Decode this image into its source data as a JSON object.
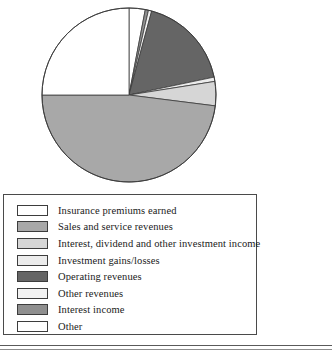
{
  "chart_data": {
    "type": "pie",
    "title": "",
    "subtitle": "",
    "xlabel": "",
    "ylabel": "",
    "legend_position": "bottom-left",
    "start_angle_deg": 0,
    "direction": "clockwise",
    "categories": [
      "Insurance premiums earned",
      "Sales and service revenues",
      "Interest, dividend and other investment income",
      "Investment gains/losses",
      "Operating revenues",
      "Other revenues",
      "Interest income",
      "Other"
    ],
    "values": [
      25.0,
      48.0,
      4.5,
      0.8,
      17.5,
      0.6,
      0.6,
      3.0
    ],
    "slice_colors": [
      "#ffffff",
      "#a8a8a8",
      "#d6d6d6",
      "#ececec",
      "#656565",
      "#f2f2f2",
      "#8f8f8f",
      "#ffffff"
    ],
    "slice_order_from_12oclock": [
      "Other",
      "Interest income",
      "Other revenues",
      "Operating revenues",
      "Investment gains/losses",
      "Interest, dividend and other investment income",
      "Sales and service revenues",
      "Insurance premiums earned"
    ],
    "geometry": {
      "center_x": 129,
      "center_y": 95,
      "radius": 87
    }
  },
  "legend": {
    "items": [
      {
        "label": "Insurance premiums earned",
        "color": "#ffffff"
      },
      {
        "label": "Sales and service revenues",
        "color": "#a8a8a8"
      },
      {
        "label": "Interest, dividend and other investment income",
        "color": "#d6d6d6"
      },
      {
        "label": "Investment gains/losses",
        "color": "#ececec"
      },
      {
        "label": "Operating revenues",
        "color": "#656565"
      },
      {
        "label": "Other revenues",
        "color": "#f2f2f2"
      },
      {
        "label": "Interest income",
        "color": "#8f8f8f"
      },
      {
        "label": "Other",
        "color": "#ffffff"
      }
    ]
  },
  "style": {
    "outline_color": "#3d3d3d",
    "legend_border_color": "#4a4a4a",
    "background": "#ffffff"
  }
}
